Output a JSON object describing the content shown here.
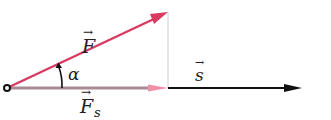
{
  "diagram": {
    "labels": {
      "force": "F",
      "force_component": "F",
      "force_component_subscript": "s",
      "angle": "α",
      "displacement": "s",
      "vector_arrow": "→"
    },
    "colors": {
      "force": "#d83a62",
      "force_component_line": "#a78a94",
      "force_component_head": "#ee8fa8",
      "displacement": "#111111",
      "projection_line": "#c8c8c8",
      "origin": "#111111",
      "text": "#222222"
    },
    "geometry": {
      "origin": [
        7,
        88
      ],
      "force_tip": [
        168,
        12
      ],
      "component_tip": [
        168,
        88
      ],
      "displacement_start": [
        168,
        88
      ],
      "displacement_tip": [
        300,
        88
      ]
    }
  }
}
